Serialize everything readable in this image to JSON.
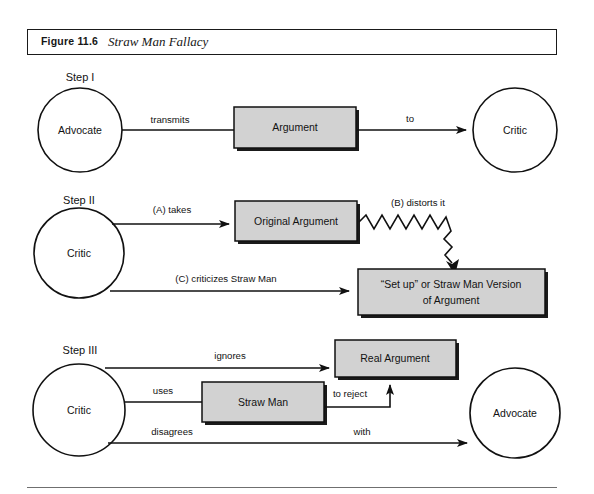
{
  "figure": {
    "number": "Figure 11.6",
    "title": "Straw Man Fallacy"
  },
  "colors": {
    "box_fill": "#d2d2d2",
    "box_stroke": "#111111",
    "shadow": "#1a1a1a",
    "line": "#111111",
    "rule": "#6f6f6f",
    "page_bg": "#ffffff"
  },
  "steps": [
    {
      "id": "step-1",
      "label": "Step I",
      "nodes": [
        {
          "id": "s1-advocate",
          "type": "circle",
          "label": "Advocate"
        },
        {
          "id": "s1-argument",
          "type": "box",
          "label": "Argument"
        },
        {
          "id": "s1-critic",
          "type": "circle",
          "label": "Critic"
        }
      ],
      "edges": [
        {
          "id": "s1-transmits",
          "label": "transmits",
          "from": "s1-advocate",
          "to": "s1-argument",
          "style": "line"
        },
        {
          "id": "s1-to",
          "label": "to",
          "from": "s1-argument",
          "to": "s1-critic",
          "style": "arrow"
        }
      ]
    },
    {
      "id": "step-2",
      "label": "Step II",
      "nodes": [
        {
          "id": "s2-critic",
          "type": "circle",
          "label": "Critic"
        },
        {
          "id": "s2-original",
          "type": "box",
          "label": "Original Argument"
        },
        {
          "id": "s2-strawversion",
          "type": "box",
          "label_line1": "“Set up” or Straw Man Version",
          "label_line2": "of Argument"
        }
      ],
      "edges": [
        {
          "id": "s2-takes",
          "label": "(A) takes",
          "from": "s2-critic",
          "to": "s2-original",
          "style": "arrow"
        },
        {
          "id": "s2-distorts",
          "label": "(B) distorts it",
          "from": "s2-original",
          "to": "s2-strawversion",
          "style": "zigzag-arrow"
        },
        {
          "id": "s2-criticizes",
          "label": "(C) criticizes Straw Man",
          "from": "s2-critic",
          "to": "s2-strawversion",
          "style": "arrow"
        }
      ]
    },
    {
      "id": "step-3",
      "label": "Step III",
      "nodes": [
        {
          "id": "s3-critic",
          "type": "circle",
          "label": "Critic"
        },
        {
          "id": "s3-strawman",
          "type": "box",
          "label": "Straw Man"
        },
        {
          "id": "s3-realargument",
          "type": "box",
          "label": "Real Argument"
        },
        {
          "id": "s3-advocate",
          "type": "circle",
          "label": "Advocate"
        }
      ],
      "edges": [
        {
          "id": "s3-ignores",
          "label": "ignores",
          "from": "s3-critic",
          "to": "s3-realargument",
          "style": "arrow"
        },
        {
          "id": "s3-uses",
          "label": "uses",
          "from": "s3-critic",
          "to": "s3-strawman",
          "style": "line"
        },
        {
          "id": "s3-toreject",
          "label": "to reject",
          "from": "s3-strawman",
          "to": "s3-realargument",
          "style": "arrow"
        },
        {
          "id": "s3-disagrees",
          "label": "disagrees",
          "from": "s3-critic",
          "to": "s3-advocate",
          "style": "arrow"
        },
        {
          "id": "s3-with",
          "label": "with",
          "from": "s3-critic",
          "to": "s3-advocate",
          "style": "arrow"
        }
      ]
    }
  ]
}
